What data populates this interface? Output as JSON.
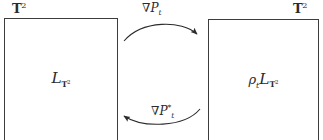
{
  "diagram": {
    "type": "two-panel-transport-diagram",
    "background_color": "#ffffff",
    "stroke_color": "#3c3c3c",
    "text_color": "#2b2b2b",
    "panels": {
      "left": {
        "corner_label": {
          "base": "T",
          "superscript": "2"
        },
        "content": {
          "operator": "L",
          "subscript_base": "T",
          "subscript_superscript": "2"
        }
      },
      "right": {
        "corner_label": {
          "base": "T",
          "superscript": "2"
        },
        "content": {
          "prefix_base": "ρ",
          "prefix_subscript": "t",
          "operator": "L",
          "subscript_base": "T",
          "subscript_superscript": "2"
        }
      }
    },
    "arrows": {
      "forward": {
        "direction": "left-to-right",
        "curvature": "arc-up",
        "label": {
          "nabla": "∇",
          "base": "P",
          "subscript": "t",
          "superscript": ""
        }
      },
      "backward": {
        "direction": "right-to-left",
        "curvature": "arc-down",
        "label": {
          "nabla": "∇",
          "base": "P",
          "subscript": "t",
          "superscript": "*"
        }
      }
    }
  }
}
